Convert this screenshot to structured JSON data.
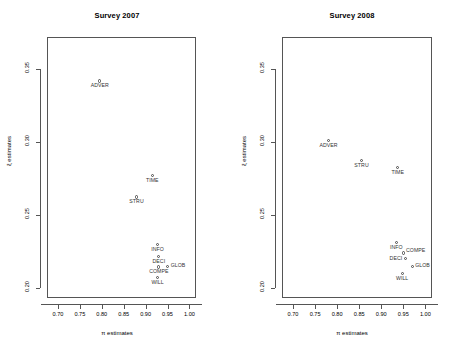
{
  "figure": {
    "background_color": "#ffffff",
    "foreground_color": "#000000",
    "axis_color": "#555555",
    "marker_color": "#4a4a4a",
    "label_color": "#333333"
  },
  "axis": {
    "x_title": "π estimates",
    "y_title": "ξ estimates",
    "x_ticks": [
      "0.70",
      "0.75",
      "0.80",
      "0.85",
      "0.90",
      "0.95",
      "1.00"
    ],
    "y_ticks": [
      "0.20",
      "0.25",
      "0.30",
      "0.35"
    ]
  },
  "chart_data": [
    {
      "type": "scatter",
      "title": "Survey 2007",
      "xlabel": "π estimates",
      "ylabel": "ξ estimates",
      "xlim": [
        0.675,
        1.015
      ],
      "ylim": [
        0.193,
        0.372
      ],
      "xticks": [
        0.7,
        0.75,
        0.8,
        0.85,
        0.9,
        0.95,
        1.0
      ],
      "yticks": [
        0.2,
        0.25,
        0.3,
        0.35
      ],
      "grid": false,
      "legend": "none",
      "points": [
        {
          "label": "ADVER",
          "x": 0.793,
          "y": 0.3425,
          "label_pos": "below"
        },
        {
          "label": "TIME",
          "x": 0.913,
          "y": 0.2775,
          "label_pos": "below"
        },
        {
          "label": "STRU",
          "x": 0.877,
          "y": 0.263,
          "label_pos": "below"
        },
        {
          "label": "INFO",
          "x": 0.925,
          "y": 0.2305,
          "label_pos": "below"
        },
        {
          "label": "DECI",
          "x": 0.928,
          "y": 0.222,
          "label_pos": "below"
        },
        {
          "label": "COMPE",
          "x": 0.928,
          "y": 0.215,
          "label_pos": "below"
        },
        {
          "label": "GLOB",
          "x": 0.948,
          "y": 0.2155,
          "label_pos": "right"
        },
        {
          "label": "WILL",
          "x": 0.925,
          "y": 0.2075,
          "label_pos": "below"
        }
      ]
    },
    {
      "type": "scatter",
      "title": "Survey 2008",
      "xlabel": "π estimates",
      "ylabel": "ξ estimates",
      "xlim": [
        0.675,
        1.015
      ],
      "ylim": [
        0.193,
        0.372
      ],
      "xticks": [
        0.7,
        0.75,
        0.8,
        0.85,
        0.9,
        0.95,
        1.0
      ],
      "yticks": [
        0.2,
        0.25,
        0.3,
        0.35
      ],
      "grid": false,
      "legend": "none",
      "points": [
        {
          "label": "ADVER",
          "x": 0.778,
          "y": 0.3015,
          "label_pos": "below"
        },
        {
          "label": "STRU",
          "x": 0.853,
          "y": 0.288,
          "label_pos": "below"
        },
        {
          "label": "TIME",
          "x": 0.935,
          "y": 0.283,
          "label_pos": "below"
        },
        {
          "label": "COMPE",
          "x": 0.948,
          "y": 0.2245,
          "label_pos": "upright"
        },
        {
          "label": "INFO",
          "x": 0.932,
          "y": 0.232,
          "label_pos": "below"
        },
        {
          "label": "DECI",
          "x": 0.952,
          "y": 0.2205,
          "label_pos": "left"
        },
        {
          "label": "GLOB",
          "x": 0.968,
          "y": 0.2155,
          "label_pos": "right"
        },
        {
          "label": "WILL",
          "x": 0.945,
          "y": 0.2105,
          "label_pos": "below"
        }
      ]
    }
  ]
}
